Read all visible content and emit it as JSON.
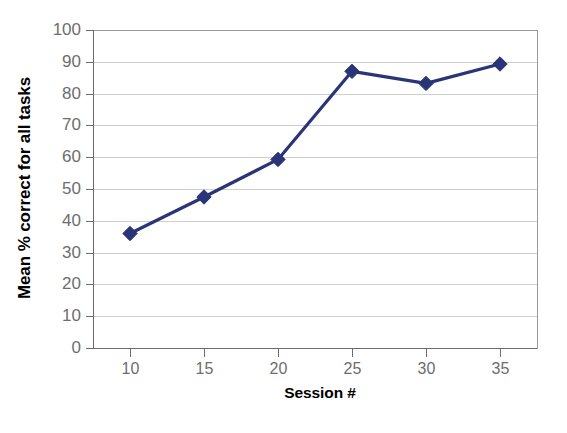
{
  "chart_data": {
    "type": "line",
    "title": "",
    "subtitle": "",
    "xlabel": "Session #",
    "ylabel": "Mean % correct for all tasks",
    "x": [
      10,
      15,
      20,
      25,
      30,
      35
    ],
    "categories": [
      "10",
      "15",
      "20",
      "25",
      "30",
      "35"
    ],
    "series": [
      {
        "name": "Mean % correct",
        "values": [
          36.0,
          47.5,
          59.3,
          87.0,
          83.2,
          89.3
        ],
        "color": "#2a3578",
        "marker": "diamond",
        "line_width": 3.2
      }
    ],
    "xlim": [
      7.5,
      37.5
    ],
    "ylim": [
      0,
      100
    ],
    "x_ticks": [
      10,
      15,
      20,
      25,
      30,
      35
    ],
    "x_tick_labels": [
      "10",
      "15",
      "20",
      "25",
      "30",
      "35"
    ],
    "y_ticks": [
      0,
      10,
      20,
      30,
      40,
      50,
      60,
      70,
      80,
      90,
      100
    ],
    "y_tick_labels": [
      "0",
      "10",
      "20",
      "30",
      "40",
      "50",
      "60",
      "70",
      "80",
      "90",
      "100"
    ],
    "grid": {
      "horizontal": true,
      "vertical": false,
      "color": "#cfcfcf"
    },
    "legend": {
      "visible": false,
      "position": "none",
      "entries": []
    },
    "annotations": [],
    "colors": {
      "series": "#2a3578",
      "grid": "#cfcfcf",
      "axis": "#6b6b6b",
      "plot_border": "#9a9a9a",
      "tick_label": "#6d6d6d",
      "axis_title": "#000000",
      "background": "#ffffff"
    }
  }
}
